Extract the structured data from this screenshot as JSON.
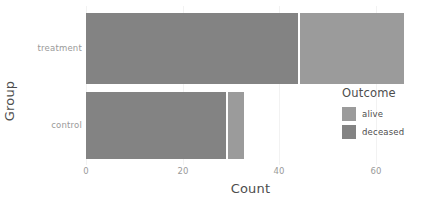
{
  "chart_data": {
    "type": "bar",
    "orientation": "horizontal",
    "stacked": true,
    "title": "",
    "xlabel": "Count",
    "ylabel": "Group",
    "categories": [
      "treatment",
      "control"
    ],
    "category_order_top_to_bottom": [
      "treatment",
      "control"
    ],
    "series": [
      {
        "name": "deceased",
        "values": [
          47,
          31
        ],
        "color": "#838383"
      },
      {
        "name": "alive",
        "values": [
          23.5,
          4
        ],
        "color": "#9b9b9b"
      }
    ],
    "totals": [
      70.5,
      35
    ],
    "xlim": [
      0,
      73
    ],
    "xticks": [
      0,
      20,
      40,
      60
    ],
    "xtick_labels": [
      "0",
      "20",
      "40",
      "60"
    ],
    "grid": true,
    "legend": {
      "title": "Outcome",
      "position": "right",
      "entries": [
        {
          "label": "alive",
          "color": "#9b9b9b"
        },
        {
          "label": "deceased",
          "color": "#838383"
        }
      ]
    },
    "colors": {
      "alive": "#9b9b9b",
      "deceased": "#838383",
      "panel_background": "#ffffff",
      "gridline": "#f2f2f2",
      "axis_text": "#9a9a9a",
      "axis_title": "#4d4d4d"
    }
  }
}
